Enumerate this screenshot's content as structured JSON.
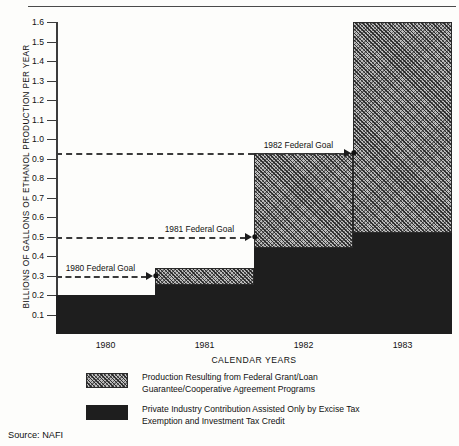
{
  "chart_data": {
    "type": "area",
    "title": "",
    "xlabel": "CALENDAR YEARS",
    "ylabel": "BILLIONS OF GALLONS OF ETHANOL PRODUCTION PER YEAR",
    "categories": [
      "1980",
      "1981",
      "1982",
      "1983"
    ],
    "ylim": [
      0,
      1.6
    ],
    "ytick_labels": [
      "1.6",
      "1.5",
      "1.4",
      "1.3",
      "1.2",
      "1.1",
      "1.0",
      "0.9",
      "0.8",
      "0.7",
      "0.6",
      "0.5",
      "0.4",
      "0.3",
      "0.2",
      "0.1"
    ],
    "ytick_values": [
      1.6,
      1.5,
      1.4,
      1.3,
      1.2,
      1.1,
      1.0,
      0.9,
      0.8,
      0.7,
      0.6,
      0.5,
      0.4,
      0.3,
      0.2,
      0.1
    ],
    "grid": false,
    "legend_position": "below",
    "series": [
      {
        "name": "Private Industry Contribution Assisted Only by Excise Tax Exemption and Investment Tax Credit",
        "key": "private",
        "color": "#1e1e1e",
        "pattern": "solid-dark",
        "values": [
          0.2,
          0.25,
          0.44,
          0.52
        ]
      },
      {
        "name": "Production Resulting from Federal Grant/Loan Guarantee/Cooperative Agreement Programs",
        "key": "federal",
        "color": "#bdbdbd",
        "pattern": "crosshatch",
        "values": [
          0.0,
          0.09,
          0.49,
          1.08
        ]
      }
    ],
    "cumulative_tops": [
      0.2,
      0.34,
      0.93,
      1.6
    ],
    "annotations": [
      {
        "label": "1980 Federal Goal",
        "value": 0.3,
        "target_category": "1981"
      },
      {
        "label": "1981 Federal Goal",
        "value": 0.5,
        "target_category": "1982"
      },
      {
        "label": "1982 Federal Goal",
        "value": 0.93,
        "target_category": "1983"
      }
    ]
  },
  "axis": {
    "y_title": "BILLIONS OF GALLONS OF ETHANOL PRODUCTION PER YEAR",
    "x_title": "CALENDAR YEARS",
    "y_ticks": [
      "1.6",
      "1.5",
      "1.4",
      "1.3",
      "1.2",
      "1.1",
      "1.0",
      "0.9",
      "0.8",
      "0.7",
      "0.6",
      "0.5",
      "0.4",
      "0.3",
      "0.2",
      "0.1"
    ],
    "x_ticks": [
      "1980",
      "1981",
      "1982",
      "1983"
    ]
  },
  "goals": [
    {
      "label": "1980 Federal Goal"
    },
    {
      "label": "1981 Federal Goal"
    },
    {
      "label": "1982 Federal Goal"
    }
  ],
  "legend": {
    "items": [
      {
        "swatch": "crosshatch",
        "line1": "Production Resulting from Federal Grant/Loan",
        "line2": "Guarantee/Cooperative Agreement Programs"
      },
      {
        "swatch": "solid-dark",
        "line1": "Private Industry Contribution Assisted Only by Excise Tax",
        "line2": "Exemption and Investment Tax Credit"
      }
    ]
  },
  "source": {
    "text": "Source:  NAFI"
  },
  "colors": {
    "dark_series": "#1e1e1e",
    "hatch_series": "#bdbdbd",
    "axis": "#3c3c3c",
    "background": "#fdfdfb"
  }
}
